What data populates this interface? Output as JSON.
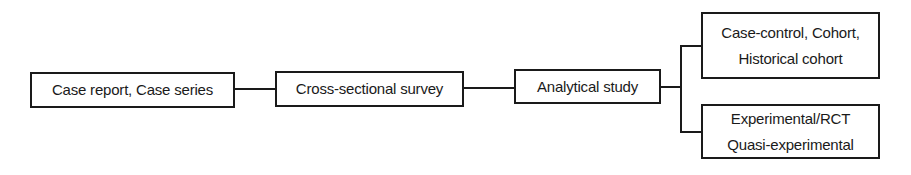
{
  "diagram": {
    "type": "flow-hierarchy",
    "nodes": [
      {
        "id": "case-report",
        "label": "Case report, Case series"
      },
      {
        "id": "cross-sectional",
        "label": "Cross-sectional survey"
      },
      {
        "id": "analytical",
        "label": "Analytical study"
      },
      {
        "id": "observational-analytic",
        "lines": [
          "Case-control, Cohort,",
          "Historical cohort"
        ]
      },
      {
        "id": "experimental",
        "lines": [
          "Experimental/RCT",
          "Quasi-experimental"
        ]
      }
    ],
    "edges": [
      {
        "from": "case-report",
        "to": "cross-sectional"
      },
      {
        "from": "cross-sectional",
        "to": "analytical"
      },
      {
        "from": "analytical",
        "to": "observational-analytic"
      },
      {
        "from": "analytical",
        "to": "experimental"
      }
    ],
    "colors": {
      "stroke": "#1a1a1a",
      "fill": "#ffffff",
      "text": "#1a1a1a"
    }
  }
}
